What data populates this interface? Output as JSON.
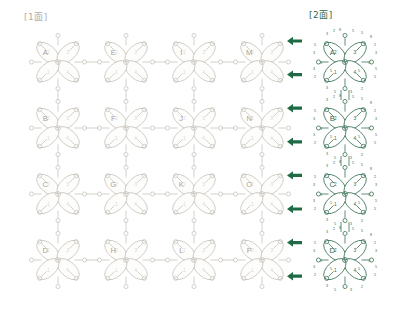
{
  "panels": {
    "left": {
      "title": "[1面]",
      "color": "#b3aca6",
      "motif_labels": [
        "A",
        "E",
        "I",
        "M",
        "B",
        "F",
        "J",
        "N",
        "C",
        "G",
        "K",
        "O",
        "D",
        "H",
        "L",
        "P"
      ],
      "petal_numbers": [
        "1",
        "2",
        "3",
        "4"
      ],
      "grid_cols": 4,
      "grid_rows": 4
    },
    "right": {
      "title": "[2面]",
      "color": "#2f6b4f",
      "motif_labels": [
        "A",
        "B",
        "C",
        "D"
      ],
      "petal_numbers": [
        "1",
        "2",
        "3",
        "4"
      ],
      "stitch_counts": [
        "3",
        "2",
        "8",
        "5",
        "5",
        "8",
        "2",
        "3",
        "5",
        "3",
        "3",
        "5",
        "5",
        "3",
        "3",
        "5",
        "3",
        "2",
        "5",
        "5",
        "2",
        "3"
      ],
      "grid_cols": 1,
      "grid_rows": 4
    }
  },
  "arrows": {
    "count": 8,
    "direction": "left",
    "color": "#1f6b46",
    "glyph": "arrow-left-icon"
  },
  "diagram": {
    "type": "tatting-lace-chart",
    "motif_shape": "four-petal-clover",
    "petals_per_motif": 4
  }
}
